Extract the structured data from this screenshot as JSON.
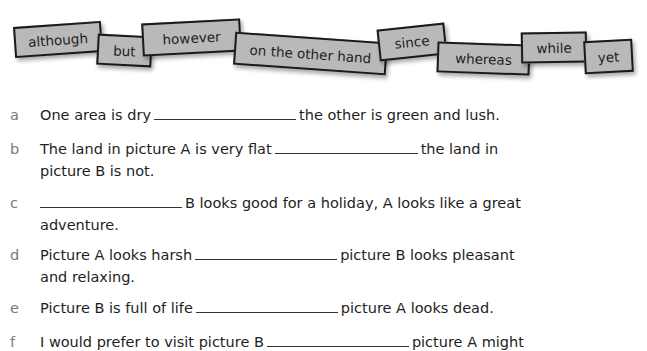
{
  "word_bank": [
    {
      "word": "although"
    },
    {
      "word": "but"
    },
    {
      "word": "however"
    },
    {
      "word": "on the other hand"
    },
    {
      "word": "since"
    },
    {
      "word": "whereas"
    },
    {
      "word": "while"
    },
    {
      "word": "yet"
    }
  ],
  "exercises": [
    {
      "letter": "a",
      "before": "One area is dry",
      "after": "the other is green and lush.",
      "line2": ""
    },
    {
      "letter": "b",
      "before": "The land in picture A is very flat",
      "after": "the land in",
      "line2": "picture B is not."
    },
    {
      "letter": "c",
      "before": "",
      "after": "B looks good for a holiday, A looks like a great",
      "line2": "adventure."
    },
    {
      "letter": "d",
      "before": "Picture A looks harsh",
      "after": "picture B looks pleasant",
      "line2": "and relaxing."
    },
    {
      "letter": "e",
      "before": "Picture B is full of life",
      "after": "picture A looks dead.",
      "line2": ""
    },
    {
      "letter": "f",
      "before": "I would prefer to visit picture B",
      "after": "picture A might",
      "line2": ""
    }
  ]
}
